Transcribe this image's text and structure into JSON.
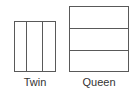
{
  "figure": {
    "type": "bed-size-comparison-diagram",
    "background_color": "#ffffff",
    "line_color": "#595959",
    "text_color": "#333333"
  },
  "items": [
    {
      "id": "twin",
      "label": "Twin",
      "orientation": "vertical-panels",
      "panel_count": 3,
      "panels": [
        "",
        "",
        ""
      ]
    },
    {
      "id": "queen",
      "label": "Queen",
      "orientation": "horizontal-panels",
      "panel_count": 3,
      "panels": [
        "",
        "",
        ""
      ]
    }
  ]
}
